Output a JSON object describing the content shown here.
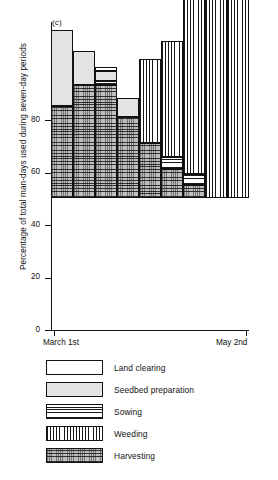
{
  "figure": {
    "panel_label": "(c)"
  },
  "chart_data": {
    "type": "bar",
    "title": "",
    "subtitle": "",
    "stacked": true,
    "xlabel": "",
    "ylabel": "Percentage of total man-days used during seven-day periods",
    "ylim": [
      0,
      120
    ],
    "yticks": [
      0,
      20,
      40,
      60,
      80
    ],
    "ytick_labels": [
      "0",
      "20",
      "40",
      "60",
      "80"
    ],
    "grid": false,
    "legend_position": "below-plot",
    "x_axis_type": "seven-day periods",
    "x_endpoint_labels": [
      "March 1st",
      "May 2nd"
    ],
    "categories": [
      "period-1",
      "period-2",
      "period-3",
      "period-4",
      "period-5",
      "period-6",
      "period-7",
      "period-8",
      "period-9"
    ],
    "series": [
      {
        "name": "Land clearing",
        "pattern": "blank-white",
        "values": [
          0,
          0,
          1.5,
          0,
          0,
          0,
          0,
          0,
          0
        ]
      },
      {
        "name": "Seedbed preparation",
        "pattern": "stipple-light",
        "values": [
          29,
          13,
          4,
          7,
          0,
          0,
          0,
          3,
          0
        ]
      },
      {
        "name": "Sowing",
        "pattern": "horizontal-lines",
        "values": [
          0,
          0,
          1.5,
          0,
          0,
          4.5,
          4,
          0,
          0
        ]
      },
      {
        "name": "Weeding",
        "pattern": "vertical-lines",
        "values": [
          0,
          0,
          0,
          0,
          32,
          44.5,
          76,
          85,
          120
        ]
      },
      {
        "name": "Harvesting",
        "pattern": "diagonal-hatch",
        "values": [
          35,
          43,
          43,
          31,
          21,
          11,
          5,
          0,
          0
        ]
      }
    ],
    "totals": [
      64,
      56,
      50,
      38,
      53,
      60,
      85,
      88,
      120
    ],
    "colors": {
      "land_clearing": "#ffffff",
      "seedbed_preparation": "#e3e3e3",
      "sowing": "#ffffff",
      "weeding": "#ffffff",
      "harvesting": "#bfbfbf",
      "outline": "#111111",
      "background": "#ffffff"
    }
  },
  "legend": {
    "items": [
      {
        "label": "Land clearing",
        "pattern": "p-land"
      },
      {
        "label": "Seedbed preparation",
        "pattern": "p-seedbed"
      },
      {
        "label": "Sowing",
        "pattern": "p-sowing"
      },
      {
        "label": "Weeding",
        "pattern": "p-weeding"
      },
      {
        "label": "Harvesting",
        "pattern": "p-harvesting"
      }
    ]
  }
}
